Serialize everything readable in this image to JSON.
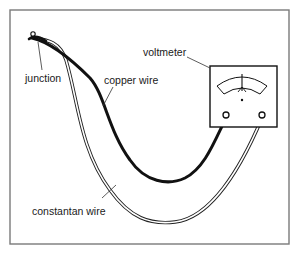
{
  "diagram": {
    "labels": {
      "junction": "junction",
      "copper_wire": "copper wire",
      "voltmeter": "voltmeter",
      "constantan_wire": "constantan wire"
    },
    "colors": {
      "frame": "#7a7a7a",
      "ink": "#111111",
      "paper": "#ffffff"
    }
  }
}
